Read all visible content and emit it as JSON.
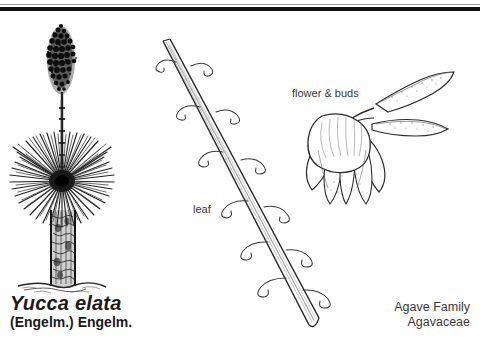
{
  "plate": {
    "background_color": "#ffffff",
    "ink_color": "#1a1a1a",
    "top_rule_thin_color": "#9a9a9a",
    "top_rule_thick_color": "#111111"
  },
  "taxon": {
    "scientific_name": "Yucca elata",
    "authority": "(Engelm.) Engelm.",
    "family_common": "Agave Family",
    "family_scientific": "Agavaceae"
  },
  "labels": {
    "leaf": "leaf",
    "flower_and_buds": "flower & buds"
  },
  "figures": {
    "habit": {
      "name": "whole-plant-habit",
      "parts": [
        "inflorescence-panicle",
        "flower-stalk",
        "leaf-rosette",
        "trunk",
        "ground-line"
      ]
    },
    "leaf_detail": {
      "name": "leaf-detail",
      "parts": [
        "leaf-blade",
        "marginal-fibers",
        "leaf-base"
      ]
    },
    "flower_detail": {
      "name": "flower-and-buds-detail",
      "parts": [
        "pendant-flower",
        "tepals",
        "buds",
        "pedicel"
      ]
    }
  }
}
